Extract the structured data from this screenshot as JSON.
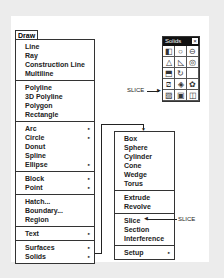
{
  "draw_menu": {
    "title": "Draw",
    "groups": [
      [
        {
          "label": "Line"
        },
        {
          "label": "Ray"
        },
        {
          "label": "Construction Line"
        },
        {
          "label": "Multiline"
        }
      ],
      [
        {
          "label": "Polyline"
        },
        {
          "label": "3D Polyline"
        },
        {
          "label": "Polygon"
        },
        {
          "label": "Rectangle"
        }
      ],
      [
        {
          "label": "Arc",
          "submenu": true
        },
        {
          "label": "Circle",
          "submenu": true
        },
        {
          "label": "Donut"
        },
        {
          "label": "Spline"
        },
        {
          "label": "Ellipse",
          "submenu": true
        }
      ],
      [
        {
          "label": "Block",
          "submenu": true
        },
        {
          "label": "Point",
          "submenu": true
        }
      ],
      [
        {
          "label": "Hatch..."
        },
        {
          "label": "Boundary..."
        },
        {
          "label": "Region"
        }
      ],
      [
        {
          "label": "Text",
          "submenu": true
        }
      ],
      [
        {
          "label": "Surfaces",
          "submenu": true
        },
        {
          "label": "Solids",
          "submenu": true
        }
      ]
    ]
  },
  "solids_menu": {
    "groups": [
      [
        {
          "label": "Box"
        },
        {
          "label": "Sphere"
        },
        {
          "label": "Cylinder"
        },
        {
          "label": "Cone"
        },
        {
          "label": "Wedge"
        },
        {
          "label": "Torus"
        }
      ],
      [
        {
          "label": "Extrude"
        },
        {
          "label": "Revolve"
        }
      ],
      [
        {
          "label": "Slice"
        },
        {
          "label": "Section"
        },
        {
          "label": "Interference"
        }
      ],
      [
        {
          "label": "Setup",
          "submenu": true
        }
      ]
    ]
  },
  "toolbar": {
    "title": "Solids",
    "close": "×",
    "icons": [
      "box-icon",
      "sphere-icon",
      "cylinder-icon",
      "cone-icon",
      "wedge-icon",
      "torus-icon",
      "extrude-icon",
      "revolve-icon",
      "",
      "slice-icon",
      "section-icon",
      "interference-icon",
      "setup-drawing-icon",
      "setup-view-icon",
      "setup-profile-icon"
    ]
  },
  "callouts": {
    "toolbar_slice": "SLICE",
    "menu_slice": "SLICE"
  },
  "submenu_arrow": "▸"
}
